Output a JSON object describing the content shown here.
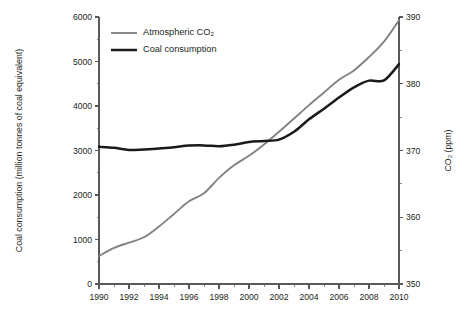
{
  "chart_data": {
    "type": "line",
    "title": "",
    "xlabel": "",
    "x": [
      1990,
      1991,
      1992,
      1993,
      1994,
      1995,
      1996,
      1997,
      1998,
      1999,
      2000,
      2001,
      2002,
      2003,
      2004,
      2005,
      2006,
      2007,
      2008,
      2009,
      2010
    ],
    "xlim": [
      1990,
      2010
    ],
    "xticks_major": [
      1990,
      1992,
      1994,
      1996,
      1998,
      2000,
      2002,
      2004,
      2006,
      2008,
      2010
    ],
    "xticks_major_labels": [
      "1990",
      "1992",
      "1994",
      "1996",
      "1998",
      "2000",
      "2002",
      "2004",
      "2006",
      "2008",
      "2010"
    ],
    "xticks_minor": [
      1991,
      1993,
      1995,
      1997,
      1999,
      2001,
      2003,
      2005,
      2007,
      2009
    ],
    "grid": false,
    "legend_position": "top-left-inside",
    "axes": [
      {
        "id": "left",
        "label": "Coal consumption (million tonnes of coal equivalent)",
        "lim": [
          0,
          6000
        ],
        "ticks_major": [
          0,
          1000,
          2000,
          3000,
          4000,
          5000,
          6000
        ],
        "ticks_major_labels": [
          "0",
          "1000",
          "2000",
          "3000",
          "4000",
          "5000",
          "6000"
        ],
        "ticks_minor": [
          500,
          1500,
          2500,
          3500,
          4500,
          5500
        ]
      },
      {
        "id": "right",
        "label": "CO₂ (ppm)",
        "lim": [
          350,
          390
        ],
        "ticks_major": [
          350,
          360,
          370,
          380,
          390
        ],
        "ticks_major_labels": [
          "350",
          "360",
          "370",
          "380",
          "390"
        ],
        "ticks_minor": [
          355,
          365,
          375,
          385
        ]
      }
    ],
    "series": [
      {
        "name": "Atmospheric CO₂",
        "axis": "right",
        "color": "#808285",
        "width": 1.9,
        "unit": "ppm",
        "values": [
          354.2,
          355.4,
          356.2,
          357.0,
          358.6,
          360.5,
          362.4,
          363.6,
          365.9,
          367.8,
          369.2,
          370.9,
          372.8,
          374.8,
          376.8,
          378.7,
          380.6,
          382.0,
          384.0,
          386.3,
          389.5
        ]
      },
      {
        "name": "Coal consumption",
        "axis": "left",
        "color": "#1a1a1a",
        "width": 2.5,
        "unit": "million tonnes of coal equivalent",
        "values": [
          3085,
          3060,
          3010,
          3025,
          3045,
          3075,
          3110,
          3115,
          3095,
          3130,
          3190,
          3215,
          3245,
          3420,
          3700,
          3940,
          4190,
          4420,
          4570,
          4575,
          4940
        ]
      }
    ],
    "legend": [
      {
        "label": "Atmospheric CO₂",
        "color": "#808285",
        "width": 1.9
      },
      {
        "label": "Coal consumption",
        "color": "#1a1a1a",
        "width": 2.5
      }
    ]
  },
  "geometry": {
    "plot_left": 99,
    "plot_right": 399,
    "plot_top": 17,
    "plot_bottom": 284
  }
}
